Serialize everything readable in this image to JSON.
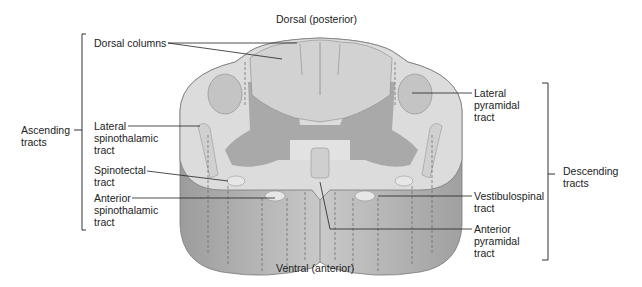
{
  "diagram": {
    "title_top": "Dorsal (posterior)",
    "title_bottom": "Ventral (anterior)",
    "groups": {
      "ascending": {
        "label_line1": "Ascending",
        "label_line2": "tracts"
      },
      "descending": {
        "label_line1": "Descending",
        "label_line2": "tracts"
      }
    },
    "labels": {
      "dorsal_columns": "Dorsal columns",
      "lateral_spinothalamic": [
        "Lateral",
        "spinothalamic",
        "tract"
      ],
      "spinotectal": [
        "Spinotectal",
        "tract"
      ],
      "anterior_spinothalamic": [
        "Anterior",
        "spinothalamic",
        "tract"
      ],
      "lateral_pyramidal": [
        "Lateral",
        "pyramidal",
        "tract"
      ],
      "vestibulospinal": [
        "Vestibulospinal",
        "tract"
      ],
      "anterior_pyramidal": [
        "Anterior",
        "pyramidal",
        "tract"
      ]
    },
    "colors": {
      "white_matter": "#dcdcdc",
      "gray_matter": "#a9a9a9",
      "tract": "#c4c4c4",
      "column_side": "#b0b0b0",
      "outline": "#7a7a7a",
      "leader": "#222222"
    }
  }
}
